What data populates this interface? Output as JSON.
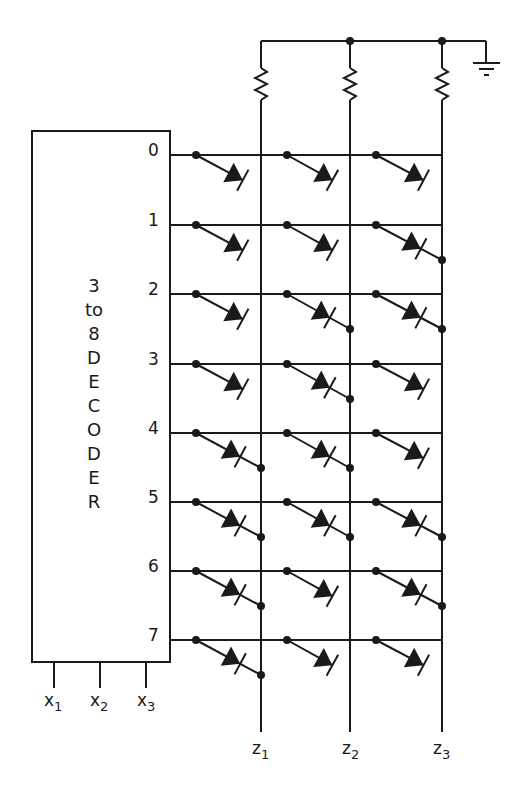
{
  "diagram": {
    "title_lines": [
      "3",
      "to",
      "8",
      "D",
      "E",
      "C",
      "O",
      "D",
      "E",
      "R"
    ],
    "decoder_outputs": [
      "0",
      "1",
      "2",
      "3",
      "4",
      "5",
      "6",
      "7"
    ],
    "inputs": [
      {
        "base": "x",
        "sub": "1"
      },
      {
        "base": "x",
        "sub": "2"
      },
      {
        "base": "x",
        "sub": "3"
      }
    ],
    "outputs": [
      {
        "base": "z",
        "sub": "1"
      },
      {
        "base": "z",
        "sub": "2"
      },
      {
        "base": "z",
        "sub": "3"
      }
    ],
    "connections": [
      [
        0,
        0,
        0
      ],
      [
        0,
        0,
        1
      ],
      [
        0,
        1,
        1
      ],
      [
        0,
        1,
        0
      ],
      [
        1,
        1,
        0
      ],
      [
        1,
        1,
        1
      ],
      [
        1,
        0,
        1
      ],
      [
        1,
        0,
        0
      ]
    ],
    "components": {
      "pull_resistors": 3,
      "ground_symbol": "ground-icon",
      "diode_symbol": "diode-icon"
    },
    "colors": {
      "ink": "#1a1a1a",
      "background": "#ffffff"
    }
  }
}
